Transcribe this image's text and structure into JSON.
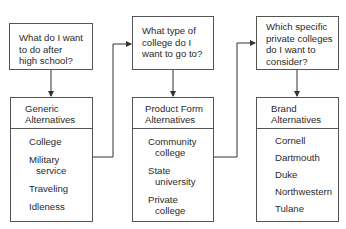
{
  "columns": [
    {
      "question": [
        "What do I want",
        "to do after",
        "high school?"
      ],
      "header": [
        "Generic",
        "Alternatives"
      ],
      "items": [
        [
          "College"
        ],
        [
          "Military",
          "service"
        ],
        [
          "Traveling"
        ],
        [
          "Idleness"
        ]
      ]
    },
    {
      "question": [
        "What type of",
        "college do I",
        "want to go to?"
      ],
      "header": [
        "Product Form",
        "Alternatives"
      ],
      "items": [
        [
          "Community",
          "college"
        ],
        [
          "State",
          "university"
        ],
        [
          "Private",
          "college"
        ]
      ]
    },
    {
      "question": [
        "Which specific",
        "private colleges",
        "do I want to",
        "consider?"
      ],
      "header": [
        "Brand",
        "Alternatives"
      ],
      "items": [
        [
          "Cornell"
        ],
        [
          "Dartmouth"
        ],
        [
          "Duke"
        ],
        [
          "Northwestern"
        ],
        [
          "Tulane"
        ]
      ]
    }
  ]
}
